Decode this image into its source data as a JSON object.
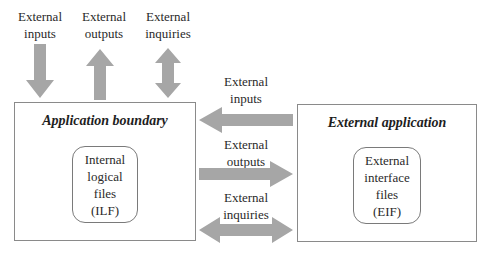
{
  "diagram": {
    "arrow_color": "#a6a6a6",
    "top_flows": [
      {
        "id": "ei",
        "line1": "External",
        "line2": "inputs",
        "direction": "down"
      },
      {
        "id": "eo",
        "line1": "External",
        "line2": "outputs",
        "direction": "up"
      },
      {
        "id": "eq",
        "line1": "External",
        "line2": "inquiries",
        "direction": "both"
      }
    ],
    "side_flows": [
      {
        "id": "ei",
        "line1": "External",
        "line2": "inputs",
        "direction": "left"
      },
      {
        "id": "eo",
        "line1": "External",
        "line2": "outputs",
        "direction": "right"
      },
      {
        "id": "eq",
        "line1": "External",
        "line2": "inquiries",
        "direction": "both"
      }
    ],
    "application_boundary": {
      "title": "Application boundary",
      "store": {
        "line1": "Internal",
        "line2": "logical",
        "line3": "files",
        "line4": "(ILF)"
      }
    },
    "external_application": {
      "title": "External application",
      "store": {
        "line1": "External",
        "line2": "interface",
        "line3": "files",
        "line4": "(EIF)"
      }
    }
  }
}
